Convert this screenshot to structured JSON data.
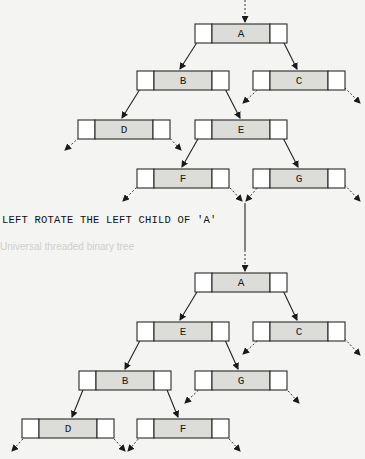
{
  "caption": "LEFT ROTATE THE LEFT CHILD OF 'A'",
  "background_heading": "Universal threaded binary tree",
  "colors": {
    "background": "#f4f4f2",
    "node_fill_center": "#dcdcd8",
    "node_fill_side": "#ffffff",
    "stroke": "#2a2a2a",
    "faint_text": "#d6d6d2"
  },
  "trees": [
    {
      "name": "before-rotation",
      "nodes": [
        {
          "label": "A",
          "x": 195,
          "y": 24
        },
        {
          "label": "B",
          "x": 137,
          "y": 71
        },
        {
          "label": "C",
          "x": 253,
          "y": 71
        },
        {
          "label": "D",
          "x": 78,
          "y": 120
        },
        {
          "label": "E",
          "x": 195,
          "y": 120
        },
        {
          "label": "F",
          "x": 137,
          "y": 169
        },
        {
          "label": "G",
          "x": 253,
          "y": 169
        }
      ],
      "edges": [
        [
          "A",
          "B"
        ],
        [
          "A",
          "C"
        ],
        [
          "B",
          "D"
        ],
        [
          "B",
          "E"
        ],
        [
          "E",
          "F"
        ],
        [
          "E",
          "G"
        ]
      ]
    },
    {
      "name": "after-rotation",
      "nodes": [
        {
          "label": "A",
          "x": 195,
          "y": 273
        },
        {
          "label": "E",
          "x": 137,
          "y": 322
        },
        {
          "label": "C",
          "x": 253,
          "y": 322
        },
        {
          "label": "B",
          "x": 79,
          "y": 371
        },
        {
          "label": "G",
          "x": 195,
          "y": 371
        },
        {
          "label": "D",
          "x": 22,
          "y": 419
        },
        {
          "label": "F",
          "x": 137,
          "y": 419
        }
      ],
      "edges": [
        [
          "A",
          "E"
        ],
        [
          "A",
          "C"
        ],
        [
          "E",
          "B"
        ],
        [
          "E",
          "G"
        ],
        [
          "B",
          "D"
        ],
        [
          "B",
          "F"
        ]
      ]
    }
  ]
}
